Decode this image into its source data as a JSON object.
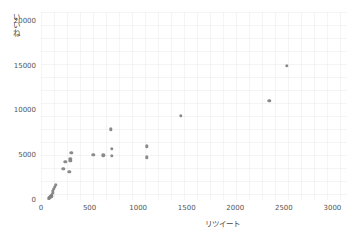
{
  "chart_data": {
    "type": "scatter",
    "title": "",
    "xlabel": "リツイート",
    "ylabel": "いいね",
    "xlim": [
      0,
      3150
    ],
    "ylim": [
      0,
      21000
    ],
    "xticks": [
      0,
      500,
      1000,
      1500,
      2000,
      2500,
      3000
    ],
    "xtick_labels": [
      "0",
      "500",
      "1000",
      "1500",
      "2000",
      "2500",
      "3000"
    ],
    "yticks": [
      0,
      5000,
      10000,
      15000,
      20000
    ],
    "ytick_labels": [
      "0",
      "5000",
      "10000",
      "15000",
      "20000"
    ],
    "grid": true,
    "legend": null,
    "marker_color": "#808080",
    "marker_size": 3.4,
    "points": [
      {
        "x": 2530,
        "y": 15000
      },
      {
        "x": 2350,
        "y": 11100
      },
      {
        "x": 1440,
        "y": 9400
      },
      {
        "x": 720,
        "y": 7900
      },
      {
        "x": 730,
        "y": 5700
      },
      {
        "x": 1090,
        "y": 6000
      },
      {
        "x": 730,
        "y": 4950
      },
      {
        "x": 1090,
        "y": 4750
      },
      {
        "x": 540,
        "y": 5050
      },
      {
        "x": 640,
        "y": 5000
      },
      {
        "x": 310,
        "y": 5250
      },
      {
        "x": 250,
        "y": 4300
      },
      {
        "x": 300,
        "y": 4600
      },
      {
        "x": 300,
        "y": 4400
      },
      {
        "x": 230,
        "y": 3500
      },
      {
        "x": 290,
        "y": 3150
      },
      {
        "x": 150,
        "y": 1700
      },
      {
        "x": 140,
        "y": 1500
      },
      {
        "x": 130,
        "y": 1250
      },
      {
        "x": 120,
        "y": 1050
      },
      {
        "x": 120,
        "y": 800
      },
      {
        "x": 110,
        "y": 600
      },
      {
        "x": 105,
        "y": 420
      },
      {
        "x": 95,
        "y": 330
      },
      {
        "x": 90,
        "y": 250
      },
      {
        "x": 80,
        "y": 180
      }
    ]
  },
  "axes": {
    "plot_left_px": 41,
    "plot_top_px": 12,
    "plot_width_px": 306,
    "plot_height_px": 188
  }
}
